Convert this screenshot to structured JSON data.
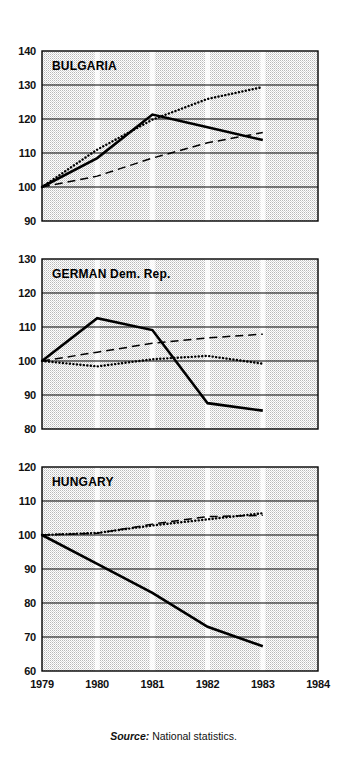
{
  "figure": {
    "source_prefix": "Source:",
    "source_text": "National statistics.",
    "x_tick_labels": [
      "1979",
      "1980",
      "1981",
      "1982",
      "1983",
      "1984"
    ]
  },
  "chart_data": [
    {
      "type": "line",
      "title": "BULGARIA",
      "xlabel": "",
      "ylabel": "",
      "x": [
        1979,
        1980,
        1981,
        1982,
        1983
      ],
      "xlim": [
        1979,
        1984
      ],
      "ylim": [
        90,
        140
      ],
      "yticks": [
        90,
        100,
        110,
        120,
        130,
        140
      ],
      "ytick_labels": [
        "90",
        "100",
        "110",
        "120",
        "130",
        "140"
      ],
      "grid": true,
      "legend": "none",
      "series": [
        {
          "name": "solid",
          "style": "solid",
          "values": [
            100.0,
            108.5,
            121.3,
            117.6,
            113.8
          ]
        },
        {
          "name": "dotted",
          "style": "dotted",
          "values": [
            100.0,
            111.0,
            119.8,
            125.9,
            129.4
          ]
        },
        {
          "name": "dashed",
          "style": "dashed",
          "values": [
            100.0,
            103.2,
            108.5,
            113.0,
            116.0
          ]
        }
      ]
    },
    {
      "type": "line",
      "title": "GERMAN Dem. Rep.",
      "xlabel": "",
      "ylabel": "",
      "x": [
        1979,
        1980,
        1981,
        1982,
        1983
      ],
      "xlim": [
        1979,
        1984
      ],
      "ylim": [
        80,
        130
      ],
      "yticks": [
        80,
        90,
        100,
        110,
        120,
        130
      ],
      "ytick_labels": [
        "80",
        "90",
        "100",
        "110",
        "120",
        "130"
      ],
      "grid": true,
      "legend": "none",
      "series": [
        {
          "name": "solid",
          "style": "solid",
          "values": [
            100.0,
            112.6,
            109.1,
            87.6,
            85.4
          ]
        },
        {
          "name": "dotted",
          "style": "dotted",
          "values": [
            100.0,
            98.4,
            100.5,
            101.5,
            99.2
          ]
        },
        {
          "name": "dashed",
          "style": "dashed",
          "values": [
            100.0,
            102.6,
            105.2,
            106.8,
            107.9
          ]
        }
      ]
    },
    {
      "type": "line",
      "title": "HUNGARY",
      "xlabel": "",
      "ylabel": "",
      "x": [
        1979,
        1980,
        1981,
        1982,
        1983
      ],
      "xlim": [
        1979,
        1984
      ],
      "ylim": [
        60,
        120
      ],
      "yticks": [
        60,
        70,
        80,
        90,
        100,
        110,
        120
      ],
      "ytick_labels": [
        "60",
        "70",
        "80",
        "90",
        "100",
        "110",
        "120"
      ],
      "grid": true,
      "legend": "none",
      "series": [
        {
          "name": "solid",
          "style": "solid",
          "values": [
            100.0,
            91.5,
            83.0,
            73.0,
            67.3
          ]
        },
        {
          "name": "dotted",
          "style": "dotted",
          "values": [
            100.0,
            100.6,
            102.8,
            104.6,
            106.4
          ]
        },
        {
          "name": "dashed",
          "style": "dashed",
          "values": [
            100.0,
            100.5,
            103.2,
            105.4,
            105.8
          ]
        }
      ]
    }
  ]
}
